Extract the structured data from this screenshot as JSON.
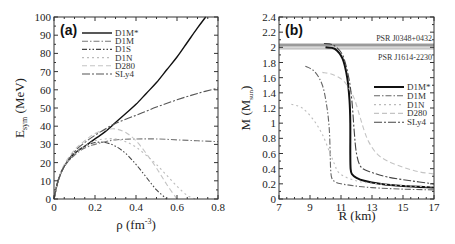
{
  "chart_data": [
    {
      "panel": "(a)",
      "type": "line",
      "xlabel": "ρ (fm^-3)",
      "ylabel": "E_sym (MeV)",
      "xlim": [
        0,
        0.8
      ],
      "ylim": [
        0,
        100
      ],
      "xticks": [
        "0",
        "0.2",
        "0.4",
        "0.6",
        "0.8"
      ],
      "yticks": [
        "0",
        "10",
        "20",
        "30",
        "40",
        "50",
        "60",
        "70",
        "80",
        "90",
        "100"
      ],
      "legend_position": "upper-left",
      "grid": false,
      "series": [
        {
          "name": "D1M*",
          "style": "solid",
          "color": "#111111",
          "x": [
            0,
            0.02,
            0.05,
            0.1,
            0.15,
            0.2,
            0.25,
            0.3,
            0.35,
            0.4,
            0.45,
            0.5,
            0.55,
            0.6,
            0.65,
            0.7,
            0.74
          ],
          "y": [
            0,
            10,
            18,
            25,
            29,
            33,
            37,
            42,
            47,
            52,
            58,
            64,
            71,
            78,
            86,
            94,
            100
          ]
        },
        {
          "name": "D1M",
          "style": "dash-dot",
          "color": "#777777",
          "x": [
            0,
            0.02,
            0.05,
            0.1,
            0.15,
            0.2,
            0.25,
            0.3,
            0.4,
            0.5,
            0.6,
            0.7,
            0.8
          ],
          "y": [
            0,
            10,
            18,
            24,
            28,
            30,
            31.5,
            32.5,
            33,
            33,
            32.5,
            32,
            31.5
          ]
        },
        {
          "name": "D1S",
          "style": "dash-dot-dot",
          "color": "#444444",
          "x": [
            0,
            0.02,
            0.05,
            0.1,
            0.15,
            0.2,
            0.25,
            0.3,
            0.35,
            0.4,
            0.45,
            0.5,
            0.55
          ],
          "y": [
            0,
            10,
            18,
            25,
            29,
            31,
            31,
            29,
            25,
            19,
            12,
            5,
            0
          ]
        },
        {
          "name": "D1N",
          "style": "dotted",
          "color": "#bbbbbb",
          "x": [
            0,
            0.02,
            0.05,
            0.1,
            0.15,
            0.2,
            0.25,
            0.3,
            0.35,
            0.4,
            0.45,
            0.5,
            0.55,
            0.6,
            0.65,
            0.69
          ],
          "y": [
            0,
            10,
            18,
            25,
            29,
            32,
            33,
            33,
            31.5,
            28.5,
            24,
            19,
            13,
            7,
            2,
            0
          ]
        },
        {
          "name": "D280",
          "style": "dashed",
          "color": "#c4c4c4",
          "x": [
            0,
            0.02,
            0.05,
            0.1,
            0.15,
            0.2,
            0.25,
            0.3,
            0.35,
            0.4,
            0.45,
            0.5,
            0.55,
            0.6
          ],
          "y": [
            0,
            10,
            19,
            27,
            32,
            36,
            38,
            38.5,
            36.5,
            32,
            25,
            17,
            8,
            0
          ]
        },
        {
          "name": "SLy4",
          "style": "long-dash-dot",
          "color": "#555555",
          "x": [
            0,
            0.02,
            0.05,
            0.1,
            0.15,
            0.2,
            0.25,
            0.3,
            0.4,
            0.5,
            0.6,
            0.7,
            0.8
          ],
          "y": [
            0,
            10,
            18,
            26,
            31,
            35,
            38.5,
            41.5,
            46,
            50.5,
            54.5,
            58,
            61
          ]
        }
      ]
    },
    {
      "panel": "(b)",
      "type": "line",
      "xlabel": "R (km)",
      "ylabel": "M (M_sun)",
      "xlim": [
        7,
        17
      ],
      "ylim": [
        0,
        2.4
      ],
      "xticks": [
        "7",
        "9",
        "11",
        "13",
        "15",
        "17"
      ],
      "yticks": [
        "0",
        "0.2",
        "0.4",
        "0.6",
        "0.8",
        "1",
        "1.2",
        "1.4",
        "1.6",
        "1.8",
        "2",
        "2.2",
        "2.4"
      ],
      "legend_position": "center-right",
      "grid": false,
      "annotations": [
        {
          "text": "PSR J0348+0432",
          "band": [
            2.01,
            2.05
          ],
          "color": "#888888"
        },
        {
          "text": "PSR J1614-2230",
          "band": [
            1.97,
            2.0
          ],
          "color": "#bbbbbb"
        }
      ],
      "series": [
        {
          "name": "D1M*",
          "style": "solid",
          "color": "#111111",
          "x": [
            10.0,
            10.6,
            11.1,
            11.4,
            11.55,
            11.6,
            11.6,
            11.62,
            11.7,
            12.0,
            12.5,
            13.5,
            15,
            17
          ],
          "y": [
            2.0,
            1.98,
            1.85,
            1.6,
            1.3,
            1.0,
            0.6,
            0.4,
            0.33,
            0.28,
            0.24,
            0.2,
            0.17,
            0.15
          ]
        },
        {
          "name": "D1M",
          "style": "dash-dot",
          "color": "#666666",
          "x": [
            8.7,
            9.3,
            9.8,
            10.1,
            10.25,
            10.3,
            10.33,
            10.4,
            10.6,
            11,
            12,
            13,
            15,
            17
          ],
          "y": [
            1.75,
            1.68,
            1.5,
            1.2,
            0.9,
            0.6,
            0.4,
            0.28,
            0.23,
            0.2,
            0.17,
            0.15,
            0.13,
            0.12
          ]
        },
        {
          "name": "D1N",
          "style": "dotted",
          "color": "#bbbbbb",
          "x": [
            7.8,
            8.5,
            9.2,
            9.8,
            10.3,
            10.6,
            10.8,
            11.2,
            11.8,
            12.5,
            14,
            15.5,
            17
          ],
          "y": [
            1.25,
            1.2,
            1.05,
            0.85,
            0.6,
            0.45,
            0.36,
            0.3,
            0.25,
            0.22,
            0.19,
            0.17,
            0.16
          ]
        },
        {
          "name": "D280",
          "style": "dashed",
          "color": "#c4c4c4",
          "x": [
            9.8,
            10.5,
            11.2,
            11.8,
            12.2,
            12.5,
            12.8,
            13.3,
            14,
            15,
            16,
            17
          ],
          "y": [
            1.67,
            1.64,
            1.55,
            1.35,
            1.1,
            0.9,
            0.75,
            0.6,
            0.5,
            0.42,
            0.36,
            0.33
          ]
        },
        {
          "name": "SLy4",
          "style": "long-dash-dot",
          "color": "#444444",
          "x": [
            9.9,
            10.5,
            11.1,
            11.5,
            11.7,
            11.85,
            12.0,
            12.3,
            13,
            14,
            15.5,
            17
          ],
          "y": [
            2.05,
            2.03,
            1.9,
            1.6,
            1.3,
            0.9,
            0.6,
            0.42,
            0.35,
            0.29,
            0.24,
            0.2
          ]
        }
      ]
    }
  ],
  "panels": {
    "a": {
      "tag": "(a)",
      "xlabel_main": "ρ (fm",
      "xlabel_sup": "-3",
      "xlabel_end": ")",
      "ylabel_main": "E",
      "ylabel_sub": "sym",
      "ylabel_end": " (MeV)",
      "legend": [
        "D1M*",
        "D1M",
        "D1S",
        "D1N",
        "D280",
        "SLy4"
      ]
    },
    "b": {
      "tag": "(b)",
      "xlabel": "R (km)",
      "ylabel_main": "M (M",
      "ylabel_sub": "sun",
      "ylabel_end": ")",
      "psr1": "PSR J0348+0432",
      "psr2": "PSR J1614-2230",
      "legend": [
        "D1M*",
        "D1M",
        "D1N",
        "D280",
        "SLy4"
      ]
    }
  }
}
